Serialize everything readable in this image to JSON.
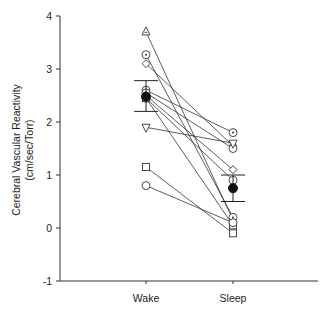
{
  "chart_data": {
    "type": "line",
    "title": "",
    "xlabel": "",
    "ylabel": "Cerebral Vascular Reactivity",
    "ylabel_units": "(cm/sec/Torr)",
    "categories": [
      "Wake",
      "Sleep"
    ],
    "ylim": [
      -1,
      4
    ],
    "yticks": [
      -1,
      0,
      1,
      2,
      3,
      4
    ],
    "grid": false,
    "legend": null,
    "series": [
      {
        "name": "subject-1",
        "marker": "triangle-up",
        "values": [
          3.7,
          0.15
        ]
      },
      {
        "name": "subject-2",
        "marker": "circle-dot",
        "values": [
          3.27,
          0.2
        ]
      },
      {
        "name": "subject-3",
        "marker": "diamond",
        "values": [
          3.1,
          1.55
        ]
      },
      {
        "name": "subject-4",
        "marker": "circle-dot",
        "values": [
          2.6,
          1.8
        ]
      },
      {
        "name": "subject-5",
        "marker": "circle",
        "values": [
          2.55,
          1.5
        ]
      },
      {
        "name": "subject-6",
        "marker": "diamond",
        "values": [
          2.5,
          1.1
        ]
      },
      {
        "name": "subject-7",
        "marker": "circle",
        "values": [
          2.45,
          0.9
        ]
      },
      {
        "name": "subject-8",
        "marker": "square",
        "values": [
          2.45,
          0.05
        ]
      },
      {
        "name": "subject-9",
        "marker": "triangle-down",
        "values": [
          1.9,
          1.6
        ]
      },
      {
        "name": "subject-10",
        "marker": "square",
        "values": [
          1.15,
          -0.1
        ]
      },
      {
        "name": "subject-11",
        "marker": "circle",
        "values": [
          0.8,
          0.1
        ]
      }
    ],
    "mean": {
      "name": "mean ± SE",
      "marker": "filled",
      "values": [
        2.48,
        0.75
      ],
      "error_low": [
        2.2,
        0.5
      ],
      "error_high": [
        2.78,
        1.0
      ]
    }
  },
  "axis": {
    "ylabel_line1": "Cerebral Vascular Reactivity",
    "ylabel_line2": "(cm/sec/Torr)",
    "ytick_labels": [
      "4",
      "3",
      "2",
      "1",
      "0",
      "-1"
    ],
    "xtick_labels": [
      "Wake",
      "Sleep"
    ]
  }
}
